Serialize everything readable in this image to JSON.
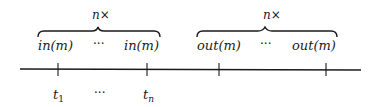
{
  "diagram": {
    "groups": [
      {
        "id": "input-group",
        "multiplier_label": "n×",
        "items": [
          "in(m)",
          "···",
          "in(m)"
        ]
      },
      {
        "id": "output-group",
        "multiplier_label": "n×",
        "items": [
          "out(m)",
          "···",
          "out(m)"
        ]
      }
    ],
    "timeline": {
      "ticks": 4,
      "labels": [
        "t",
        "1",
        "···",
        "t",
        "n"
      ]
    },
    "colors": {
      "ink": "#1a1a1a",
      "background": "#ffffff"
    }
  }
}
